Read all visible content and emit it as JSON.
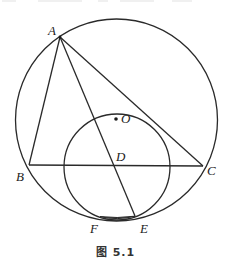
{
  "figure": {
    "caption": "图 5.1",
    "stroke_color": "#2a2a2a",
    "big_circle": {
      "cx": 116.5,
      "cy": 120,
      "r": 101
    },
    "small_circle": {
      "cx": 117,
      "cy": 167,
      "r": 53
    },
    "points": {
      "A": {
        "label": "A",
        "x": 60,
        "y": 37
      },
      "B": {
        "label": "B",
        "x": 29,
        "y": 165
      },
      "C": {
        "label": "C",
        "x": 203,
        "y": 166
      },
      "D": {
        "label": "D",
        "x": 104,
        "y": 162
      },
      "E": {
        "label": "E",
        "x": 135,
        "y": 216
      },
      "F": {
        "label": "F",
        "x": 100,
        "y": 217
      },
      "O": {
        "label": "O",
        "x": 116,
        "y": 119
      }
    },
    "segments": [
      "AB",
      "AC",
      "BC",
      "AE"
    ]
  }
}
